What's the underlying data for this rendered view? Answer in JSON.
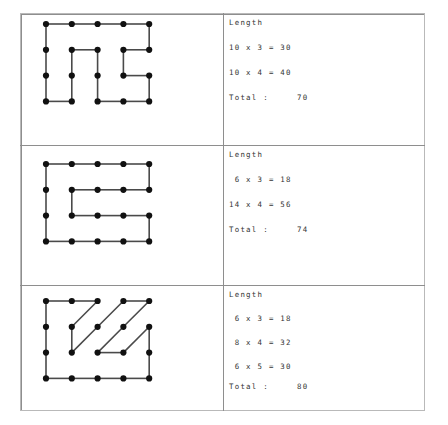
{
  "figure": {
    "kind": "worksheet-table",
    "columns": [
      "shape-diagram",
      "length-calculation"
    ],
    "frame_color": "#b9b9b9",
    "grid_line_color": "#8e8e8e",
    "edge_color": "#4a4a4a",
    "dot_color": "#111111"
  },
  "rows": [
    {
      "id": "row-1",
      "calc": {
        "header": "Length",
        "lines": [
          {
            "text": "10 x 3 = 30",
            "a": 10,
            "b": 3,
            "product": 30
          },
          {
            "text": "10 x 4 = 40",
            "a": 10,
            "b": 4,
            "product": 40
          }
        ],
        "total_label": "Total :",
        "total_value": "70"
      },
      "grid": {
        "cols": 5,
        "rows": 4
      },
      "dots": [
        [
          0,
          0
        ],
        [
          1,
          0
        ],
        [
          2,
          0
        ],
        [
          3,
          0
        ],
        [
          4,
          0
        ],
        [
          0,
          1
        ],
        [
          1,
          1
        ],
        [
          2,
          1
        ],
        [
          3,
          1
        ],
        [
          4,
          1
        ],
        [
          0,
          2
        ],
        [
          1,
          2
        ],
        [
          2,
          2
        ],
        [
          3,
          2
        ],
        [
          4,
          2
        ],
        [
          0,
          3
        ],
        [
          1,
          3
        ],
        [
          2,
          3
        ],
        [
          3,
          3
        ],
        [
          4,
          3
        ]
      ],
      "edges": [
        [
          [
            0,
            0
          ],
          [
            1,
            0
          ]
        ],
        [
          [
            1,
            0
          ],
          [
            2,
            0
          ]
        ],
        [
          [
            2,
            0
          ],
          [
            3,
            0
          ]
        ],
        [
          [
            3,
            0
          ],
          [
            4,
            0
          ]
        ],
        [
          [
            0,
            0
          ],
          [
            0,
            1
          ]
        ],
        [
          [
            0,
            1
          ],
          [
            0,
            2
          ]
        ],
        [
          [
            0,
            2
          ],
          [
            0,
            3
          ]
        ],
        [
          [
            4,
            0
          ],
          [
            4,
            1
          ]
        ],
        [
          [
            1,
            1
          ],
          [
            2,
            1
          ]
        ],
        [
          [
            3,
            1
          ],
          [
            4,
            1
          ]
        ],
        [
          [
            1,
            1
          ],
          [
            1,
            2
          ]
        ],
        [
          [
            1,
            2
          ],
          [
            1,
            3
          ]
        ],
        [
          [
            2,
            1
          ],
          [
            2,
            2
          ]
        ],
        [
          [
            2,
            2
          ],
          [
            2,
            3
          ]
        ],
        [
          [
            3,
            1
          ],
          [
            3,
            2
          ]
        ],
        [
          [
            3,
            2
          ],
          [
            4,
            2
          ]
        ],
        [
          [
            4,
            2
          ],
          [
            4,
            3
          ]
        ],
        [
          [
            0,
            3
          ],
          [
            1,
            3
          ]
        ],
        [
          [
            2,
            3
          ],
          [
            3,
            3
          ]
        ],
        [
          [
            3,
            3
          ],
          [
            4,
            3
          ]
        ]
      ]
    },
    {
      "id": "row-2",
      "calc": {
        "header": "Length",
        "lines": [
          {
            "text": " 6 x 3 = 18",
            "a": 6,
            "b": 3,
            "product": 18
          },
          {
            "text": "14 x 4 = 56",
            "a": 14,
            "b": 4,
            "product": 56
          }
        ],
        "total_label": "Total :",
        "total_value": "74"
      },
      "grid": {
        "cols": 5,
        "rows": 4
      },
      "dots": [
        [
          0,
          0
        ],
        [
          1,
          0
        ],
        [
          2,
          0
        ],
        [
          3,
          0
        ],
        [
          4,
          0
        ],
        [
          0,
          1
        ],
        [
          1,
          1
        ],
        [
          2,
          1
        ],
        [
          3,
          1
        ],
        [
          4,
          1
        ],
        [
          0,
          2
        ],
        [
          1,
          2
        ],
        [
          2,
          2
        ],
        [
          3,
          2
        ],
        [
          4,
          2
        ],
        [
          0,
          3
        ],
        [
          1,
          3
        ],
        [
          2,
          3
        ],
        [
          3,
          3
        ],
        [
          4,
          3
        ]
      ],
      "edges": [
        [
          [
            0,
            0
          ],
          [
            1,
            0
          ]
        ],
        [
          [
            1,
            0
          ],
          [
            2,
            0
          ]
        ],
        [
          [
            2,
            0
          ],
          [
            3,
            0
          ]
        ],
        [
          [
            3,
            0
          ],
          [
            4,
            0
          ]
        ],
        [
          [
            0,
            0
          ],
          [
            0,
            1
          ]
        ],
        [
          [
            0,
            1
          ],
          [
            0,
            2
          ]
        ],
        [
          [
            0,
            2
          ],
          [
            0,
            3
          ]
        ],
        [
          [
            4,
            0
          ],
          [
            4,
            1
          ]
        ],
        [
          [
            1,
            1
          ],
          [
            2,
            1
          ]
        ],
        [
          [
            2,
            1
          ],
          [
            3,
            1
          ]
        ],
        [
          [
            3,
            1
          ],
          [
            4,
            1
          ]
        ],
        [
          [
            1,
            1
          ],
          [
            1,
            2
          ]
        ],
        [
          [
            1,
            2
          ],
          [
            2,
            2
          ]
        ],
        [
          [
            2,
            2
          ],
          [
            3,
            2
          ]
        ],
        [
          [
            3,
            2
          ],
          [
            4,
            2
          ]
        ],
        [
          [
            4,
            2
          ],
          [
            4,
            3
          ]
        ],
        [
          [
            0,
            3
          ],
          [
            1,
            3
          ]
        ],
        [
          [
            1,
            3
          ],
          [
            2,
            3
          ]
        ],
        [
          [
            2,
            3
          ],
          [
            3,
            3
          ]
        ],
        [
          [
            3,
            3
          ],
          [
            4,
            3
          ]
        ]
      ]
    },
    {
      "id": "row-3",
      "calc": {
        "header": "Length",
        "lines": [
          {
            "text": " 6 x 3 = 18",
            "a": 6,
            "b": 3,
            "product": 18
          },
          {
            "text": " 8 x 4 = 32",
            "a": 8,
            "b": 4,
            "product": 32
          },
          {
            "text": " 6 x 5 = 30",
            "a": 6,
            "b": 5,
            "product": 30
          }
        ],
        "total_label": "Total :",
        "total_value": "80"
      },
      "grid": {
        "cols": 5,
        "rows": 4
      },
      "dots": [
        [
          0,
          0
        ],
        [
          1,
          0
        ],
        [
          2,
          0
        ],
        [
          3,
          0
        ],
        [
          4,
          0
        ],
        [
          0,
          1
        ],
        [
          1,
          1
        ],
        [
          2,
          1
        ],
        [
          3,
          1
        ],
        [
          4,
          1
        ],
        [
          0,
          2
        ],
        [
          1,
          2
        ],
        [
          2,
          2
        ],
        [
          3,
          2
        ],
        [
          4,
          2
        ],
        [
          0,
          3
        ],
        [
          1,
          3
        ],
        [
          2,
          3
        ],
        [
          3,
          3
        ],
        [
          4,
          3
        ]
      ],
      "edges": [
        [
          [
            0,
            0
          ],
          [
            1,
            0
          ]
        ],
        [
          [
            1,
            0
          ],
          [
            2,
            0
          ]
        ],
        [
          [
            3,
            0
          ],
          [
            4,
            0
          ]
        ],
        [
          [
            0,
            0
          ],
          [
            0,
            1
          ]
        ],
        [
          [
            0,
            1
          ],
          [
            0,
            2
          ]
        ],
        [
          [
            0,
            2
          ],
          [
            0,
            3
          ]
        ],
        [
          [
            2,
            0
          ],
          [
            1,
            1
          ]
        ],
        [
          [
            1,
            1
          ],
          [
            1,
            2
          ]
        ],
        [
          [
            4,
            0
          ],
          [
            3,
            1
          ]
        ],
        [
          [
            3,
            1
          ],
          [
            2,
            2
          ]
        ],
        [
          [
            3,
            0
          ],
          [
            2,
            1
          ]
        ],
        [
          [
            2,
            1
          ],
          [
            1,
            2
          ]
        ],
        [
          [
            2,
            2
          ],
          [
            3,
            2
          ]
        ],
        [
          [
            4,
            1
          ],
          [
            3,
            2
          ]
        ],
        [
          [
            4,
            1
          ],
          [
            4,
            2
          ]
        ],
        [
          [
            4,
            2
          ],
          [
            4,
            3
          ]
        ],
        [
          [
            0,
            3
          ],
          [
            1,
            3
          ]
        ],
        [
          [
            1,
            3
          ],
          [
            2,
            3
          ]
        ],
        [
          [
            2,
            3
          ],
          [
            3,
            3
          ]
        ],
        [
          [
            3,
            3
          ],
          [
            4,
            3
          ]
        ]
      ]
    }
  ]
}
